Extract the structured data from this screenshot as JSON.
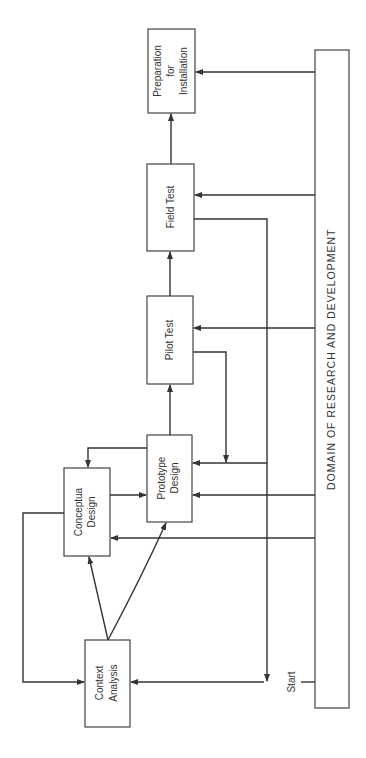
{
  "diagram": {
    "type": "process-flow",
    "orientation": "rotated-90-ccw",
    "boxes": [
      {
        "id": "context-analysis",
        "lines": [
          "Context",
          "Analysis"
        ]
      },
      {
        "id": "conceptual-design",
        "lines": [
          "Conceptua",
          "Design"
        ]
      },
      {
        "id": "prototype-design",
        "lines": [
          "Prototype",
          "Design"
        ]
      },
      {
        "id": "pilot-test",
        "lines": [
          "Pilot Test"
        ]
      },
      {
        "id": "field-test",
        "lines": [
          "Field Test"
        ]
      },
      {
        "id": "preparation",
        "lines": [
          "Preparation",
          "for",
          "Installation"
        ]
      }
    ],
    "domain_bar": {
      "label": "DOMAIN OF RESEARCH AND DEVELOPMENT"
    },
    "start_label": "Start",
    "edges": [
      {
        "from": "start",
        "to": "context-analysis"
      },
      {
        "from": "context-analysis",
        "to": "conceptual-design"
      },
      {
        "from": "context-analysis",
        "to": "prototype-design"
      },
      {
        "from": "conceptual-design",
        "to": "prototype-design"
      },
      {
        "from": "conceptual-design",
        "to": "context-analysis"
      },
      {
        "from": "prototype-design",
        "to": "conceptual-design"
      },
      {
        "from": "prototype-design",
        "to": "pilot-test"
      },
      {
        "from": "pilot-test",
        "to": "field-test"
      },
      {
        "from": "pilot-test",
        "to": "prototype-design"
      },
      {
        "from": "field-test",
        "to": "preparation"
      },
      {
        "from": "field-test",
        "to": "context-analysis"
      },
      {
        "from": "domain",
        "to": "conceptual-design"
      },
      {
        "from": "domain",
        "to": "prototype-design"
      },
      {
        "from": "domain",
        "to": "pilot-test"
      },
      {
        "from": "domain",
        "to": "field-test"
      },
      {
        "from": "domain",
        "to": "preparation"
      }
    ]
  }
}
